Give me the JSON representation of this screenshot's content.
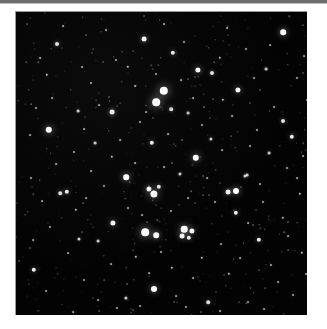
{
  "page": {
    "background_color": "#ffffff",
    "width": 327,
    "height": 329
  },
  "top_rule": {
    "color": "#6e6e6e",
    "soft_color": "#bdbdbd"
  },
  "image_plate": {
    "name": "star-field-photograph",
    "x": 15,
    "y": 11,
    "width": 292,
    "height": 304,
    "background_color": "#050505",
    "border_color": "#9a9a9a",
    "star_color": "#ffffff"
  },
  "chart_data": {
    "type": "scatter",
    "title": "",
    "xlabel": "",
    "ylabel": "",
    "xlim": [
      0,
      292
    ],
    "ylim": [
      0,
      304
    ],
    "grid": false,
    "legend": "none",
    "note": "Each point is a star. x,y are pixel coordinates within the image plate; r is the rendered radius in px; b is relative brightness 0-1 controlling glow.",
    "stars": [
      {
        "x": 148,
        "y": 79,
        "r": 4.2,
        "b": 1.0
      },
      {
        "x": 140,
        "y": 90,
        "r": 3.8,
        "b": 0.98
      },
      {
        "x": 138,
        "y": 182,
        "r": 3.6,
        "b": 0.95
      },
      {
        "x": 133,
        "y": 177,
        "r": 2.6,
        "b": 0.8
      },
      {
        "x": 143,
        "y": 175,
        "r": 2.2,
        "b": 0.72
      },
      {
        "x": 129,
        "y": 220,
        "r": 3.8,
        "b": 0.97
      },
      {
        "x": 140,
        "y": 223,
        "r": 2.8,
        "b": 0.85
      },
      {
        "x": 168,
        "y": 217,
        "r": 3.3,
        "b": 0.93
      },
      {
        "x": 176,
        "y": 219,
        "r": 2.6,
        "b": 0.82
      },
      {
        "x": 166,
        "y": 224,
        "r": 2.4,
        "b": 0.8
      },
      {
        "x": 173,
        "y": 226,
        "r": 2.2,
        "b": 0.76
      },
      {
        "x": 33,
        "y": 118,
        "r": 3.2,
        "b": 0.92
      },
      {
        "x": 180,
        "y": 146,
        "r": 3.2,
        "b": 0.92
      },
      {
        "x": 220,
        "y": 179,
        "r": 3.0,
        "b": 0.9
      },
      {
        "x": 212,
        "y": 180,
        "r": 2.4,
        "b": 0.78
      },
      {
        "x": 110,
        "y": 165,
        "r": 2.8,
        "b": 0.88
      },
      {
        "x": 97,
        "y": 211,
        "r": 2.6,
        "b": 0.86
      },
      {
        "x": 138,
        "y": 277,
        "r": 3.0,
        "b": 0.9
      },
      {
        "x": 267,
        "y": 20,
        "r": 2.8,
        "b": 0.88
      },
      {
        "x": 128,
        "y": 27,
        "r": 2.4,
        "b": 0.8
      },
      {
        "x": 41,
        "y": 32,
        "r": 2.0,
        "b": 0.72
      },
      {
        "x": 157,
        "y": 41,
        "r": 2.2,
        "b": 0.76
      },
      {
        "x": 182,
        "y": 58,
        "r": 2.6,
        "b": 0.84
      },
      {
        "x": 196,
        "y": 61,
        "r": 2.0,
        "b": 0.72
      },
      {
        "x": 222,
        "y": 78,
        "r": 2.6,
        "b": 0.84
      },
      {
        "x": 276,
        "y": 125,
        "r": 2.2,
        "b": 0.76
      },
      {
        "x": 96,
        "y": 100,
        "r": 2.4,
        "b": 0.8
      },
      {
        "x": 51,
        "y": 545,
        "r": 0.0,
        "b": 0.0
      },
      {
        "x": 51,
        "y": 180,
        "r": 2.2,
        "b": 0.78
      },
      {
        "x": 44,
        "y": 181,
        "r": 1.8,
        "b": 0.68
      },
      {
        "x": 136,
        "y": 131,
        "r": 2.2,
        "b": 0.76
      },
      {
        "x": 155,
        "y": 97,
        "r": 1.8,
        "b": 0.66
      },
      {
        "x": 18,
        "y": 258,
        "r": 2.2,
        "b": 0.78
      },
      {
        "x": 220,
        "y": 201,
        "r": 2.2,
        "b": 0.76
      },
      {
        "x": 243,
        "y": 228,
        "r": 2.2,
        "b": 0.76
      },
      {
        "x": 267,
        "y": 109,
        "r": 2.0,
        "b": 0.72
      },
      {
        "x": 192,
        "y": 290,
        "r": 1.8,
        "b": 0.68
      },
      {
        "x": 110,
        "y": 286,
        "r": 1.6,
        "b": 0.64
      },
      {
        "x": 63,
        "y": 227,
        "r": 1.6,
        "b": 0.62
      },
      {
        "x": 82,
        "y": 229,
        "r": 1.4,
        "b": 0.58
      },
      {
        "x": 229,
        "y": 164,
        "r": 1.6,
        "b": 0.62
      },
      {
        "x": 231,
        "y": 163,
        "r": 1.4,
        "b": 0.58
      },
      {
        "x": 172,
        "y": 101,
        "r": 1.4,
        "b": 0.56
      },
      {
        "x": 62,
        "y": 99,
        "r": 1.4,
        "b": 0.56
      },
      {
        "x": 79,
        "y": 131,
        "r": 1.4,
        "b": 0.56
      },
      {
        "x": 164,
        "y": 162,
        "r": 1.6,
        "b": 0.6
      },
      {
        "x": 195,
        "y": 127,
        "r": 1.6,
        "b": 0.6
      },
      {
        "x": 253,
        "y": 141,
        "r": 1.4,
        "b": 0.56
      },
      {
        "x": 207,
        "y": 88,
        "r": 1.2,
        "b": 0.5
      },
      {
        "x": 250,
        "y": 57,
        "r": 1.4,
        "b": 0.56
      },
      {
        "x": 204,
        "y": 46,
        "r": 1.2,
        "b": 0.5
      },
      {
        "x": 112,
        "y": 55,
        "r": 1.2,
        "b": 0.5
      },
      {
        "x": 31,
        "y": 63,
        "r": 1.2,
        "b": 0.5
      },
      {
        "x": 96,
        "y": 145,
        "r": 1.2,
        "b": 0.5
      },
      {
        "x": 60,
        "y": 198,
        "r": 1.2,
        "b": 0.5
      },
      {
        "x": 120,
        "y": 245,
        "r": 1.2,
        "b": 0.5
      },
      {
        "x": 156,
        "y": 256,
        "r": 1.2,
        "b": 0.5
      },
      {
        "x": 186,
        "y": 246,
        "r": 1.2,
        "b": 0.5
      },
      {
        "x": 213,
        "y": 262,
        "r": 1.2,
        "b": 0.5
      },
      {
        "x": 267,
        "y": 206,
        "r": 1.2,
        "b": 0.5
      },
      {
        "x": 284,
        "y": 182,
        "r": 1.2,
        "b": 0.5
      },
      {
        "x": 286,
        "y": 241,
        "r": 1.2,
        "b": 0.5
      },
      {
        "x": 100,
        "y": 48,
        "r": 1.0,
        "b": 0.44
      },
      {
        "x": 75,
        "y": 71,
        "r": 1.0,
        "b": 0.44
      },
      {
        "x": 140,
        "y": 62,
        "r": 1.0,
        "b": 0.44
      },
      {
        "x": 168,
        "y": 30,
        "r": 1.0,
        "b": 0.44
      },
      {
        "x": 230,
        "y": 37,
        "r": 1.0,
        "b": 0.44
      },
      {
        "x": 281,
        "y": 66,
        "r": 1.0,
        "b": 0.44
      },
      {
        "x": 20,
        "y": 96,
        "r": 1.0,
        "b": 0.44
      },
      {
        "x": 58,
        "y": 140,
        "r": 1.0,
        "b": 0.44
      },
      {
        "x": 124,
        "y": 110,
        "r": 1.0,
        "b": 0.44
      },
      {
        "x": 186,
        "y": 113,
        "r": 1.0,
        "b": 0.44
      },
      {
        "x": 241,
        "y": 118,
        "r": 1.0,
        "b": 0.44
      },
      {
        "x": 271,
        "y": 156,
        "r": 1.0,
        "b": 0.44
      },
      {
        "x": 15,
        "y": 166,
        "r": 1.0,
        "b": 0.44
      },
      {
        "x": 88,
        "y": 174,
        "r": 1.0,
        "b": 0.44
      },
      {
        "x": 112,
        "y": 196,
        "r": 1.0,
        "b": 0.44
      },
      {
        "x": 155,
        "y": 199,
        "r": 1.0,
        "b": 0.44
      },
      {
        "x": 199,
        "y": 190,
        "r": 1.0,
        "b": 0.44
      },
      {
        "x": 247,
        "y": 190,
        "r": 1.0,
        "b": 0.44
      },
      {
        "x": 34,
        "y": 215,
        "r": 1.0,
        "b": 0.44
      },
      {
        "x": 145,
        "y": 240,
        "r": 1.0,
        "b": 0.44
      },
      {
        "x": 205,
        "y": 232,
        "r": 1.0,
        "b": 0.44
      },
      {
        "x": 255,
        "y": 253,
        "r": 1.0,
        "b": 0.44
      },
      {
        "x": 68,
        "y": 268,
        "r": 1.0,
        "b": 0.44
      },
      {
        "x": 101,
        "y": 296,
        "r": 1.0,
        "b": 0.44
      },
      {
        "x": 170,
        "y": 295,
        "r": 1.0,
        "b": 0.44
      },
      {
        "x": 232,
        "y": 290,
        "r": 1.0,
        "b": 0.44
      },
      {
        "x": 277,
        "y": 283,
        "r": 1.0,
        "b": 0.44
      },
      {
        "x": 47,
        "y": 14,
        "r": 0.9,
        "b": 0.36
      },
      {
        "x": 90,
        "y": 18,
        "r": 0.9,
        "b": 0.36
      },
      {
        "x": 148,
        "y": 12,
        "r": 0.9,
        "b": 0.36
      },
      {
        "x": 211,
        "y": 16,
        "r": 0.9,
        "b": 0.36
      },
      {
        "x": 254,
        "y": 33,
        "r": 0.9,
        "b": 0.36
      },
      {
        "x": 288,
        "y": 44,
        "r": 0.9,
        "b": 0.36
      },
      {
        "x": 24,
        "y": 46,
        "r": 0.9,
        "b": 0.36
      },
      {
        "x": 66,
        "y": 55,
        "r": 0.9,
        "b": 0.36
      },
      {
        "x": 119,
        "y": 74,
        "r": 0.9,
        "b": 0.36
      },
      {
        "x": 165,
        "y": 68,
        "r": 0.9,
        "b": 0.36
      },
      {
        "x": 238,
        "y": 66,
        "r": 0.9,
        "b": 0.36
      },
      {
        "x": 291,
        "y": 88,
        "r": 0.9,
        "b": 0.36
      },
      {
        "x": 36,
        "y": 86,
        "r": 0.9,
        "b": 0.36
      },
      {
        "x": 83,
        "y": 93,
        "r": 0.9,
        "b": 0.36
      },
      {
        "x": 130,
        "y": 100,
        "r": 0.9,
        "b": 0.36
      },
      {
        "x": 177,
        "y": 86,
        "r": 0.9,
        "b": 0.36
      },
      {
        "x": 216,
        "y": 104,
        "r": 0.9,
        "b": 0.36
      },
      {
        "x": 258,
        "y": 95,
        "r": 0.9,
        "b": 0.36
      },
      {
        "x": 14,
        "y": 123,
        "r": 0.9,
        "b": 0.36
      },
      {
        "x": 68,
        "y": 117,
        "r": 0.9,
        "b": 0.36
      },
      {
        "x": 104,
        "y": 128,
        "r": 0.9,
        "b": 0.36
      },
      {
        "x": 152,
        "y": 122,
        "r": 0.9,
        "b": 0.36
      },
      {
        "x": 206,
        "y": 138,
        "r": 0.9,
        "b": 0.36
      },
      {
        "x": 234,
        "y": 134,
        "r": 0.9,
        "b": 0.36
      },
      {
        "x": 287,
        "y": 144,
        "r": 0.9,
        "b": 0.36
      },
      {
        "x": 40,
        "y": 152,
        "r": 0.9,
        "b": 0.36
      },
      {
        "x": 75,
        "y": 159,
        "r": 0.9,
        "b": 0.36
      },
      {
        "x": 119,
        "y": 151,
        "r": 0.9,
        "b": 0.36
      },
      {
        "x": 148,
        "y": 155,
        "r": 0.9,
        "b": 0.36
      },
      {
        "x": 191,
        "y": 166,
        "r": 0.9,
        "b": 0.36
      },
      {
        "x": 244,
        "y": 172,
        "r": 0.9,
        "b": 0.36
      },
      {
        "x": 281,
        "y": 166,
        "r": 0.9,
        "b": 0.36
      },
      {
        "x": 26,
        "y": 189,
        "r": 0.9,
        "b": 0.36
      },
      {
        "x": 70,
        "y": 186,
        "r": 0.9,
        "b": 0.36
      },
      {
        "x": 126,
        "y": 203,
        "r": 0.9,
        "b": 0.36
      },
      {
        "x": 172,
        "y": 186,
        "r": 0.9,
        "b": 0.36
      },
      {
        "x": 232,
        "y": 211,
        "r": 0.9,
        "b": 0.36
      },
      {
        "x": 272,
        "y": 224,
        "r": 0.9,
        "b": 0.36
      },
      {
        "x": 17,
        "y": 228,
        "r": 0.9,
        "b": 0.36
      },
      {
        "x": 52,
        "y": 241,
        "r": 0.9,
        "b": 0.36
      },
      {
        "x": 95,
        "y": 252,
        "r": 0.9,
        "b": 0.36
      },
      {
        "x": 133,
        "y": 261,
        "r": 0.9,
        "b": 0.36
      },
      {
        "x": 177,
        "y": 266,
        "r": 0.9,
        "b": 0.36
      },
      {
        "x": 224,
        "y": 246,
        "r": 0.9,
        "b": 0.36
      },
      {
        "x": 262,
        "y": 270,
        "r": 0.9,
        "b": 0.36
      },
      {
        "x": 30,
        "y": 279,
        "r": 0.9,
        "b": 0.36
      },
      {
        "x": 82,
        "y": 288,
        "r": 0.9,
        "b": 0.36
      },
      {
        "x": 124,
        "y": 294,
        "r": 0.9,
        "b": 0.36
      },
      {
        "x": 160,
        "y": 284,
        "r": 0.9,
        "b": 0.36
      },
      {
        "x": 204,
        "y": 299,
        "r": 0.9,
        "b": 0.36
      },
      {
        "x": 248,
        "y": 297,
        "r": 0.9,
        "b": 0.36
      },
      {
        "x": 290,
        "y": 262,
        "r": 0.9,
        "b": 0.36
      },
      {
        "x": 57,
        "y": 300,
        "r": 0.9,
        "b": 0.36
      },
      {
        "x": 106,
        "y": 70,
        "r": 0.7,
        "b": 0.26
      },
      {
        "x": 193,
        "y": 36,
        "r": 0.7,
        "b": 0.26
      },
      {
        "x": 272,
        "y": 53,
        "r": 0.7,
        "b": 0.26
      },
      {
        "x": 55,
        "y": 78,
        "r": 0.7,
        "b": 0.26
      },
      {
        "x": 145,
        "y": 46,
        "r": 0.7,
        "b": 0.26
      },
      {
        "x": 222,
        "y": 120,
        "r": 0.7,
        "b": 0.26
      },
      {
        "x": 93,
        "y": 119,
        "r": 0.7,
        "b": 0.26
      },
      {
        "x": 160,
        "y": 134,
        "r": 0.7,
        "b": 0.26
      },
      {
        "x": 264,
        "y": 134,
        "r": 0.7,
        "b": 0.26
      },
      {
        "x": 31,
        "y": 137,
        "r": 0.7,
        "b": 0.26
      },
      {
        "x": 108,
        "y": 180,
        "r": 0.7,
        "b": 0.26
      },
      {
        "x": 200,
        "y": 158,
        "r": 0.7,
        "b": 0.26
      },
      {
        "x": 253,
        "y": 208,
        "r": 0.7,
        "b": 0.26
      },
      {
        "x": 46,
        "y": 206,
        "r": 0.7,
        "b": 0.26
      },
      {
        "x": 88,
        "y": 244,
        "r": 0.7,
        "b": 0.26
      },
      {
        "x": 150,
        "y": 228,
        "r": 0.7,
        "b": 0.26
      },
      {
        "x": 196,
        "y": 212,
        "r": 0.7,
        "b": 0.26
      },
      {
        "x": 238,
        "y": 281,
        "r": 0.7,
        "b": 0.26
      },
      {
        "x": 72,
        "y": 208,
        "r": 0.7,
        "b": 0.26
      },
      {
        "x": 118,
        "y": 268,
        "r": 0.7,
        "b": 0.26
      },
      {
        "x": 188,
        "y": 176,
        "r": 0.7,
        "b": 0.26
      },
      {
        "x": 210,
        "y": 274,
        "r": 0.7,
        "b": 0.26
      },
      {
        "x": 266,
        "y": 240,
        "r": 0.7,
        "b": 0.26
      },
      {
        "x": 22,
        "y": 299,
        "r": 0.7,
        "b": 0.26
      },
      {
        "x": 176,
        "y": 303,
        "r": 0.7,
        "b": 0.26
      },
      {
        "x": 268,
        "y": 302,
        "r": 0.7,
        "b": 0.26
      },
      {
        "x": 42,
        "y": 262,
        "r": 0.7,
        "b": 0.26
      },
      {
        "x": 144,
        "y": 210,
        "r": 0.7,
        "b": 0.26
      },
      {
        "x": 206,
        "y": 70,
        "r": 0.7,
        "b": 0.26
      },
      {
        "x": 289,
        "y": 118,
        "r": 0.7,
        "b": 0.26
      },
      {
        "x": 13,
        "y": 78,
        "r": 0.7,
        "b": 0.26
      },
      {
        "x": 12,
        "y": 200,
        "r": 0.7,
        "b": 0.26
      }
    ]
  }
}
